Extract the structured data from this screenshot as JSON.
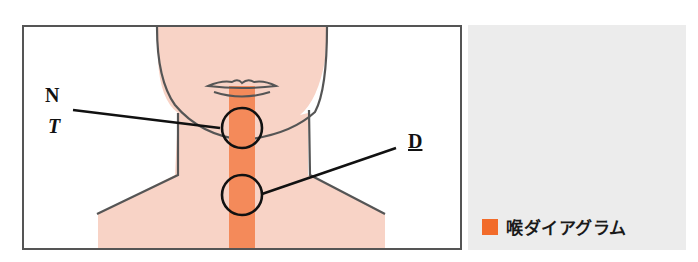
{
  "diagram": {
    "labels": {
      "n": "N",
      "t": "T",
      "d": "D"
    },
    "legend": {
      "text": "喉ダイアグラム",
      "color": "#f26b2a"
    },
    "colors": {
      "skin": "#f8d3c6",
      "throat": "#f48a5a",
      "outline": "#555555",
      "circle": "#111111",
      "panel": "#ececec"
    }
  }
}
